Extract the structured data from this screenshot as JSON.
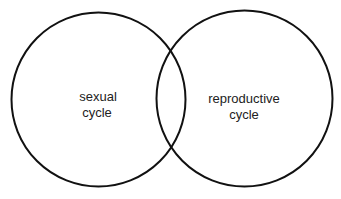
{
  "diagram": {
    "type": "venn",
    "stroke_color": "#111111",
    "text_color": "#222222",
    "background": "#ffffff",
    "sets": [
      {
        "id": "sexual-cycle",
        "label_line1": "sexual",
        "label_line2": "cycle",
        "cx": 98.5,
        "cy": 99.5,
        "r": 87
      },
      {
        "id": "reproductive-cycle",
        "label_line1": "reproductive",
        "label_line2": "cycle",
        "cx": 244.5,
        "cy": 98.5,
        "r": 88
      }
    ]
  }
}
